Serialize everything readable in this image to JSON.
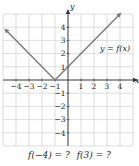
{
  "chart_data": {
    "type": "line",
    "title": "",
    "function_label": "y = f(x)",
    "xlabel": "x",
    "ylabel": "y",
    "xlim": [
      -5,
      5
    ],
    "ylim": [
      -5,
      5
    ],
    "grid": true,
    "x_ticks": [
      -4,
      -3,
      -2,
      -1,
      1,
      2,
      3,
      4
    ],
    "y_ticks": [
      -4,
      -3,
      -2,
      -1,
      1,
      2,
      3,
      4
    ],
    "series": [
      {
        "name": "f(x)",
        "x": [
          -4.8,
          -1,
          4
        ],
        "y": [
          3.8,
          0,
          5
        ],
        "arrows": "both"
      }
    ],
    "vertex": [
      -1,
      0
    ],
    "colors": {
      "curve": "#7a7a7a",
      "grid": "#c8c8c8",
      "axis": "#333333"
    }
  },
  "question": {
    "part1": "f(−4) = ?",
    "part2": "f(3) = ?"
  }
}
